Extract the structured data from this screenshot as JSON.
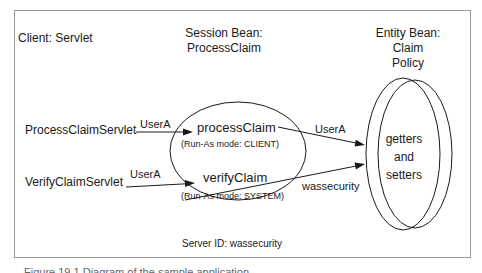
{
  "diagram": {
    "client_label": "Client: Servlet",
    "session_header": {
      "line1": "Session Bean:",
      "line2": "ProcessClaim"
    },
    "entity_header": {
      "line1": "Entity Bean:",
      "line2": "Claim",
      "line3": "Policy"
    },
    "clients": {
      "process_servlet": "ProcessClaimServlet",
      "verify_servlet": "VerifyClaimServlet"
    },
    "session_bean": {
      "process_method": {
        "name": "processClaim",
        "run_as": "(Run-As mode: CLIENT)"
      },
      "verify_method": {
        "name": "verifyClaim",
        "run_as": "(Run-As mode: SYSTEM)"
      }
    },
    "entity_bean": {
      "line1": "getters",
      "line2": "and",
      "line3": "setters"
    },
    "arrow_labels": {
      "process_left": "UserA",
      "verify_left": "UserA",
      "process_right": "UserA",
      "verify_right": "wassecurity"
    },
    "server_id": "Server ID: wassecurity",
    "caption_partial": "Figure 19.1   Diagram of the sample application",
    "colors": {
      "background": "#ffffff",
      "frame_border": "#999999",
      "line": "#1a1a1a",
      "text": "#1a1a1a"
    }
  }
}
